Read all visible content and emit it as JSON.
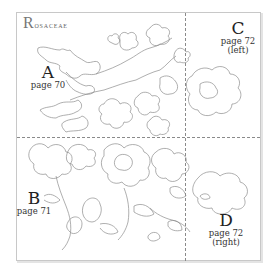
{
  "diagram": {
    "title": "Rosaceae",
    "title_initial": "R",
    "title_rest": "OSACEAE",
    "sections": [
      {
        "letter": "A",
        "page": "page 70",
        "note": ""
      },
      {
        "letter": "B",
        "page": "page 71",
        "note": ""
      },
      {
        "letter": "C",
        "page": "page 72",
        "note": "(left)"
      },
      {
        "letter": "D",
        "page": "page 72",
        "note": "(right)"
      }
    ],
    "colors": {
      "line": "#8c8c8c",
      "frame": "#c8c8c8",
      "text": "#222222"
    }
  }
}
